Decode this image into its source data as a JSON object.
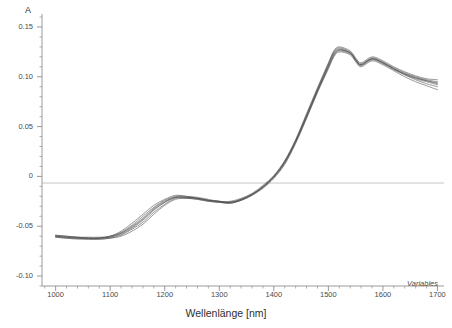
{
  "chart_data": {
    "type": "line",
    "title": "",
    "xlabel": "Wellenlänge [nm]",
    "ylabel": "A",
    "xlim": [
      975,
      1712
    ],
    "ylim": [
      -0.11,
      0.163
    ],
    "grid": false,
    "legend_position": "none",
    "annotations": [
      {
        "text": "Variables",
        "position": "bottom-right",
        "style": "italic"
      }
    ],
    "x_ticks": [
      1000,
      1100,
      1200,
      1300,
      1400,
      1500,
      1600,
      1700
    ],
    "x_tick_labels": [
      "1000",
      "1100",
      "1200",
      "1300",
      "1400",
      "1500",
      "1600",
      "1700"
    ],
    "y_ticks": [
      -0.1,
      -0.05,
      0,
      0.05,
      0.1,
      0.15
    ],
    "y_tick_labels": [
      "-0.10",
      "-0.05",
      "0",
      "0.05",
      "0.10",
      "0.15"
    ],
    "y_minor_tick_step": 0.01,
    "x_minor_tick_step": 20,
    "zero_line": 0,
    "series_color": "#4d4d4d",
    "axis_color": "#8c8c8c",
    "zero_line_color": "#b0b0b0",
    "x": [
      1000,
      1020,
      1040,
      1060,
      1080,
      1100,
      1120,
      1140,
      1160,
      1180,
      1200,
      1220,
      1240,
      1260,
      1280,
      1300,
      1320,
      1340,
      1360,
      1380,
      1400,
      1420,
      1440,
      1460,
      1480,
      1500,
      1510,
      1520,
      1540,
      1550,
      1560,
      1580,
      1600,
      1620,
      1640,
      1660,
      1680,
      1700
    ],
    "series": [
      {
        "name": "Spektrum 1",
        "values": [
          -0.06,
          -0.061,
          -0.062,
          -0.062,
          -0.062,
          -0.061,
          -0.058,
          -0.052,
          -0.044,
          -0.034,
          -0.026,
          -0.021,
          -0.021,
          -0.022,
          -0.024,
          -0.025,
          -0.026,
          -0.023,
          -0.018,
          -0.011,
          -0.001,
          0.014,
          0.035,
          0.06,
          0.086,
          0.11,
          0.122,
          0.127,
          0.124,
          0.117,
          0.112,
          0.118,
          0.114,
          0.108,
          0.103,
          0.099,
          0.096,
          0.094
        ]
      },
      {
        "name": "Spektrum 2",
        "values": [
          -0.059,
          -0.06,
          -0.061,
          -0.062,
          -0.062,
          -0.06,
          -0.056,
          -0.049,
          -0.04,
          -0.031,
          -0.024,
          -0.02,
          -0.02,
          -0.022,
          -0.024,
          -0.025,
          -0.026,
          -0.023,
          -0.018,
          -0.01,
          0.0,
          0.015,
          0.036,
          0.062,
          0.088,
          0.113,
          0.125,
          0.129,
          0.125,
          0.118,
          0.113,
          0.119,
          0.115,
          0.109,
          0.104,
          0.1,
          0.097,
          0.095
        ]
      },
      {
        "name": "Spektrum 3",
        "values": [
          -0.061,
          -0.062,
          -0.063,
          -0.063,
          -0.063,
          -0.062,
          -0.06,
          -0.055,
          -0.048,
          -0.038,
          -0.029,
          -0.023,
          -0.022,
          -0.023,
          -0.025,
          -0.026,
          -0.027,
          -0.024,
          -0.019,
          -0.011,
          -0.001,
          0.013,
          0.034,
          0.059,
          0.085,
          0.109,
          0.121,
          0.126,
          0.123,
          0.116,
          0.111,
          0.117,
          0.113,
          0.107,
          0.102,
          0.098,
          0.095,
          0.092
        ]
      },
      {
        "name": "Spektrum 4",
        "values": [
          -0.06,
          -0.061,
          -0.062,
          -0.062,
          -0.062,
          -0.061,
          -0.057,
          -0.05,
          -0.042,
          -0.032,
          -0.025,
          -0.021,
          -0.021,
          -0.022,
          -0.024,
          -0.026,
          -0.026,
          -0.024,
          -0.018,
          -0.011,
          0.0,
          0.015,
          0.036,
          0.061,
          0.087,
          0.112,
          0.124,
          0.128,
          0.124,
          0.117,
          0.112,
          0.118,
          0.114,
          0.108,
          0.102,
          0.097,
          0.093,
          0.09
        ]
      },
      {
        "name": "Spektrum 5",
        "values": [
          -0.059,
          -0.06,
          -0.061,
          -0.061,
          -0.061,
          -0.06,
          -0.055,
          -0.047,
          -0.038,
          -0.029,
          -0.023,
          -0.019,
          -0.02,
          -0.021,
          -0.023,
          -0.025,
          -0.025,
          -0.022,
          -0.017,
          -0.009,
          0.001,
          0.016,
          0.037,
          0.063,
          0.089,
          0.114,
          0.126,
          0.13,
          0.126,
          0.119,
          0.114,
          0.12,
          0.116,
          0.11,
          0.105,
          0.101,
          0.098,
          0.097
        ]
      },
      {
        "name": "Spektrum 6",
        "values": [
          -0.061,
          -0.062,
          -0.062,
          -0.063,
          -0.063,
          -0.062,
          -0.059,
          -0.053,
          -0.046,
          -0.036,
          -0.028,
          -0.022,
          -0.022,
          -0.023,
          -0.025,
          -0.026,
          -0.027,
          -0.024,
          -0.019,
          -0.012,
          -0.002,
          0.012,
          0.033,
          0.058,
          0.084,
          0.108,
          0.12,
          0.125,
          0.122,
          0.115,
          0.11,
          0.116,
          0.112,
          0.106,
          0.1,
          0.095,
          0.091,
          0.087
        ]
      },
      {
        "name": "Spektrum 7",
        "values": [
          -0.06,
          -0.061,
          -0.061,
          -0.062,
          -0.062,
          -0.06,
          -0.057,
          -0.051,
          -0.043,
          -0.033,
          -0.026,
          -0.021,
          -0.021,
          -0.022,
          -0.024,
          -0.025,
          -0.026,
          -0.023,
          -0.018,
          -0.01,
          0.0,
          0.014,
          0.035,
          0.06,
          0.086,
          0.111,
          0.123,
          0.127,
          0.124,
          0.117,
          0.112,
          0.118,
          0.114,
          0.108,
          0.103,
          0.099,
          0.096,
          0.093
        ]
      }
    ]
  }
}
